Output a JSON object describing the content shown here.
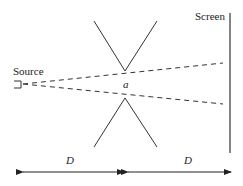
{
  "labels": {
    "screen": "Screen",
    "source": "Source",
    "aperture": "a",
    "distance_left": "D",
    "distance_right": "D"
  },
  "colors": {
    "stroke": "#333333",
    "background": "#ffffff"
  }
}
